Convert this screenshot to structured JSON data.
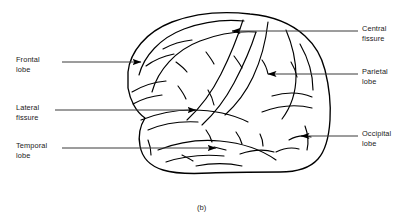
{
  "figure": {
    "caption": "(b)",
    "line_color": "#000000",
    "leader_color": "#3a3a3a",
    "text_color": "#1a1a1a",
    "background": "#ffffff"
  },
  "labels": [
    {
      "id": "frontal-lobe",
      "line1": "Frontal",
      "line2": "lobe",
      "side": "left",
      "text_x": 16,
      "text_y": 55,
      "leader_x1": 62,
      "leader_y1": 62,
      "leader_x2": 141,
      "leader_y2": 62,
      "arrow_dir": "right"
    },
    {
      "id": "lateral-fissure",
      "line1": "Lateral",
      "line2": "fissure",
      "side": "left",
      "text_x": 16,
      "text_y": 103,
      "leader_x1": 55,
      "leader_y1": 110,
      "leader_x2": 196,
      "leader_y2": 110,
      "arrow_dir": "right"
    },
    {
      "id": "temporal-lobe",
      "line1": "Temporal",
      "line2": "lobe",
      "side": "left",
      "text_x": 16,
      "text_y": 141,
      "leader_x1": 62,
      "leader_y1": 148,
      "leader_x2": 216,
      "leader_y2": 148,
      "arrow_dir": "right"
    },
    {
      "id": "central-fissure",
      "line1": "Central",
      "line2": "fissure",
      "side": "right",
      "text_x": 362,
      "text_y": 24,
      "leader_x1": 358,
      "leader_y1": 31,
      "leader_x2": 232,
      "leader_y2": 31,
      "arrow_dir": "left"
    },
    {
      "id": "parietal-lobe",
      "line1": "Parietal",
      "line2": "lobe",
      "side": "right",
      "text_x": 362,
      "text_y": 67,
      "leader_x1": 358,
      "leader_y1": 74,
      "leader_x2": 268,
      "leader_y2": 74,
      "arrow_dir": "left"
    },
    {
      "id": "occipital-lobe",
      "line1": "Occipital",
      "line2": "lobe",
      "side": "right",
      "text_x": 362,
      "text_y": 129,
      "leader_x1": 358,
      "leader_y1": 136,
      "leader_x2": 301,
      "leader_y2": 136,
      "arrow_dir": "left"
    }
  ]
}
